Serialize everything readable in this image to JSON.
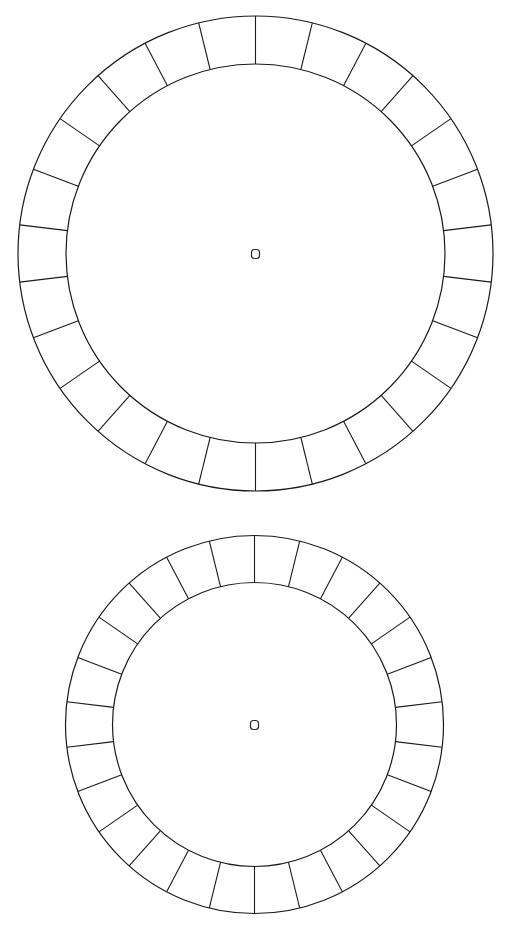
{
  "diagram": {
    "type": "segmented-ring-templates",
    "stroke_color": "#1a1a1a",
    "background": "#ffffff",
    "rings": [
      {
        "id": "ring-large",
        "center": [
          255.5,
          253.5
        ],
        "outer_radius": 237.5,
        "inner_radius": 189.5,
        "segments": 26,
        "start_angle_deg": 0,
        "center_marker": {
          "shape": "rounded-square",
          "size": 8
        }
      },
      {
        "id": "ring-small",
        "center": [
          254.5,
          724.5
        ],
        "outer_radius": 189,
        "inner_radius": 142,
        "segments": 26,
        "start_angle_deg": 0,
        "center_marker": {
          "shape": "rounded-square",
          "size": 8
        }
      }
    ]
  }
}
